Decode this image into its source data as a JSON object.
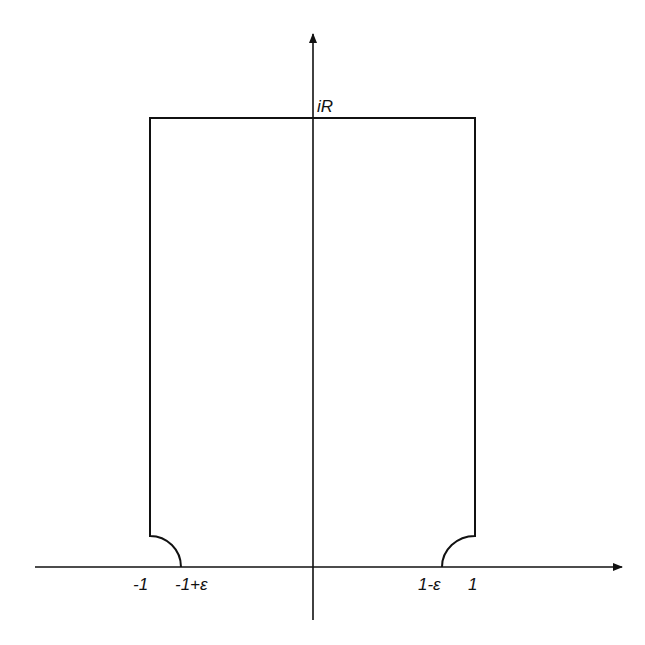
{
  "diagram": {
    "type": "contour-diagram",
    "colors": {
      "line": "#111111",
      "background": "#ffffff"
    },
    "labels": {
      "top": "iR",
      "minus_one": "-1",
      "minus_one_plus_eps": "-1+ε",
      "one_minus_eps": "1-ε",
      "one": "1"
    }
  }
}
